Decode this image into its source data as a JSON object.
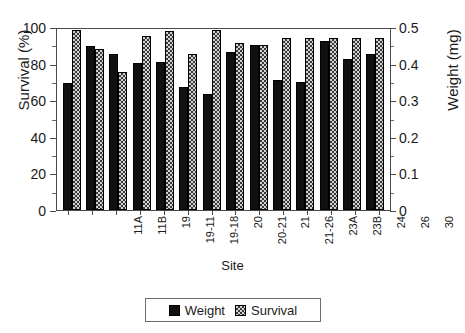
{
  "chart_data": {
    "type": "bar",
    "title": "",
    "xlabel": "Site",
    "ylabel": "Survival (%)",
    "y2label": "Weight (mg)",
    "ylim": [
      0,
      100
    ],
    "y2lim": [
      0,
      0.5
    ],
    "yticks": [
      "0",
      "20",
      "40",
      "60",
      "80",
      "100"
    ],
    "ytick_values": [
      0,
      20,
      40,
      60,
      80,
      100
    ],
    "y2ticks": [
      "0",
      "0.1",
      "0.2",
      "0.3",
      "0.4",
      "0.5"
    ],
    "y2tick_values": [
      0,
      0.1,
      0.2,
      0.3,
      0.4,
      0.5
    ],
    "grid": false,
    "legend_position": "bottom-center",
    "categories": [
      "11A",
      "11B",
      "19",
      "19-11",
      "19-18",
      "20",
      "20-21",
      "21",
      "21-26",
      "23A",
      "23B",
      "24",
      "26",
      "30"
    ],
    "series": [
      {
        "name": "Weight",
        "axis": "right",
        "unit": "mg",
        "color": "#111111",
        "pattern": "solid",
        "values": [
          0.35,
          0.452,
          0.431,
          0.407,
          0.41,
          0.341,
          0.321,
          0.437,
          0.456,
          0.36,
          0.355,
          0.468,
          0.416,
          0.432
        ]
      },
      {
        "name": "Survival",
        "axis": "left",
        "unit": "%",
        "color": "#d2d2d2",
        "pattern": "checker",
        "values": [
          99.5,
          89.0,
          76.0,
          96.0,
          99.0,
          86.0,
          99.5,
          92.0,
          91.0,
          95.0,
          95.0,
          95.0,
          95.0,
          95.0
        ]
      }
    ]
  },
  "legend": {
    "items": [
      {
        "label": "Weight",
        "pattern": "solid"
      },
      {
        "label": "Survival",
        "pattern": "checker"
      }
    ]
  }
}
